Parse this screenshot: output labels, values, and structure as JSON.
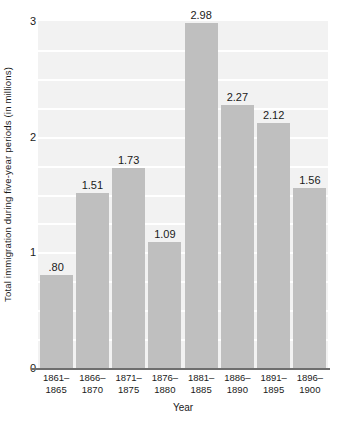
{
  "chart_data": {
    "type": "bar",
    "title": "",
    "xlabel": "Year",
    "ylabel": "Total immigration during five-year periods (in millions)",
    "categories": [
      "1861–1865",
      "1866–1870",
      "1871–1875",
      "1876–1880",
      "1881–1885",
      "1886–1890",
      "1891–1895",
      "1896–1900"
    ],
    "category_lines": [
      [
        "1861–",
        "1865"
      ],
      [
        "1866–",
        "1870"
      ],
      [
        "1871–",
        "1875"
      ],
      [
        "1876–",
        "1880"
      ],
      [
        "1881–",
        "1885"
      ],
      [
        "1886–",
        "1890"
      ],
      [
        "1891–",
        "1895"
      ],
      [
        "1896–",
        "1900"
      ]
    ],
    "values": [
      0.8,
      1.51,
      1.73,
      1.09,
      2.98,
      2.27,
      2.12,
      1.56
    ],
    "value_labels": [
      ".80",
      "1.51",
      "1.73",
      "1.09",
      "2.98",
      "2.27",
      "2.12",
      "1.56"
    ],
    "ylim": [
      0,
      3
    ],
    "y_ticks": [
      0,
      1,
      2,
      3
    ],
    "y_tick_labels": [
      "0",
      "1",
      "2",
      "3"
    ],
    "grid": true,
    "gridline_values": [
      0.25,
      0.5,
      0.75,
      1,
      1.25,
      1.5,
      1.75,
      2,
      2.25,
      2.5,
      2.75
    ],
    "legend": "none",
    "colors": {
      "bar_fill": "#bfbfbf",
      "plot_background": "#f2f2f2",
      "gridline": "#ffffff",
      "axis_line": "#6e6e6e",
      "text": "#1a1a1a",
      "page_background": "#ffffff"
    }
  }
}
